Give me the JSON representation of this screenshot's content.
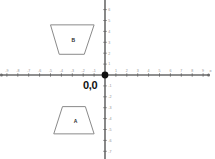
{
  "figure": {
    "type": "coordinate-plane",
    "background_color": "#ffffff",
    "axis_color": "#6b6b6b",
    "shape_stroke_color": "#8a8a8a",
    "tick_label_color": "#8f8f8f",
    "origin_label_color": "#111111"
  },
  "axes": {
    "x_axis_label": "x",
    "y_axis_label": "y",
    "origin_label": "0,0",
    "x_ticks": [
      -9,
      -8,
      -7,
      -6,
      -5,
      -4,
      -3,
      -2,
      -1,
      1,
      2,
      3,
      4,
      5,
      6,
      7,
      8,
      9
    ],
    "y_ticks": [
      7,
      6,
      5,
      4,
      3,
      2,
      1,
      -1,
      -2,
      -3,
      -4,
      -5,
      -6,
      -7,
      -8
    ],
    "x_range": [
      -9.5,
      9.5
    ],
    "y_range": [
      -8.5,
      7.5
    ],
    "grid": false
  },
  "shapes": [
    {
      "label": "B",
      "quadrant": "II",
      "orientation": "inverted-trapezoid",
      "vertices": [
        [
          -5.0,
          4.6
        ],
        [
          -1.0,
          4.6
        ],
        [
          -1.9,
          1.9
        ],
        [
          -4.2,
          1.9
        ]
      ],
      "label_point": [
        -2.9,
        3.2
      ]
    },
    {
      "label": "A",
      "quadrant": "III",
      "orientation": "upright-trapezoid",
      "vertices": [
        [
          -3.9,
          -2.9
        ],
        [
          -1.8,
          -2.9
        ],
        [
          -1.0,
          -5.4
        ],
        [
          -4.7,
          -5.4
        ]
      ],
      "label_point": [
        -2.7,
        -4.2
      ]
    }
  ],
  "chart_data": {
    "type": "scatter",
    "title": "",
    "xlabel": "x",
    "ylabel": "y",
    "xlim": [
      -9.5,
      9.5
    ],
    "ylim": [
      -8.5,
      7.5
    ],
    "grid": false,
    "annotations": [
      "0,0",
      "A",
      "B"
    ]
  }
}
